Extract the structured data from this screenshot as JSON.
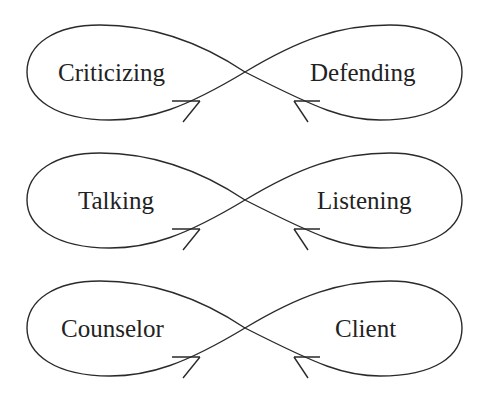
{
  "diagram": {
    "loops": [
      {
        "left_label": "Criticizing",
        "right_label": "Defending",
        "cy": 72
      },
      {
        "left_label": "Talking",
        "right_label": "Listening",
        "cy": 200
      },
      {
        "left_label": "Counselor",
        "right_label": "Client",
        "cy": 328
      }
    ]
  }
}
